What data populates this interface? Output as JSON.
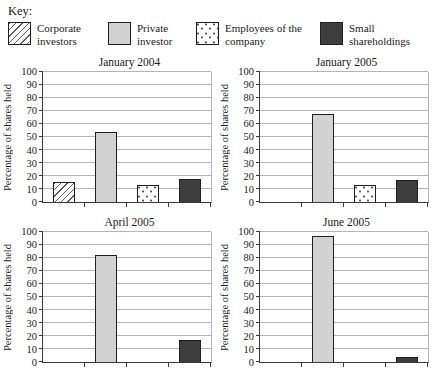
{
  "legend": {
    "heading": "Key:",
    "items": [
      {
        "label": "Corporate investors",
        "pattern": "diagonal-hatch"
      },
      {
        "label": "Private investor",
        "pattern": "solid-light-gray"
      },
      {
        "label": "Employees of the company",
        "pattern": "dotted"
      },
      {
        "label": "Small shareholdings",
        "pattern": "solid-dark-gray"
      }
    ]
  },
  "colors": {
    "light_gray_fill": "#d2d2d2",
    "dark_gray_fill": "#3d3d3d",
    "bar_border": "#1f1f1f",
    "gridline": "#b4b4b4",
    "axis": "#3a3a3a",
    "text": "#1a1a1a"
  },
  "chart_data": {
    "type": "bar",
    "title": "",
    "xlabel": "",
    "ylabel": "Percentage of shares held",
    "ylim": [
      0,
      100
    ],
    "ytick_step": 10,
    "grid": true,
    "legend_position": "top",
    "categories": [
      "Corporate investors",
      "Private investor",
      "Employees of the company",
      "Small shareholdings"
    ],
    "charts": [
      {
        "title": "January 2004",
        "values": [
          15,
          54,
          13,
          18
        ]
      },
      {
        "title": "January 2005",
        "values": [
          0,
          68,
          13,
          17
        ]
      },
      {
        "title": "April 2005",
        "values": [
          0,
          82,
          0,
          17
        ]
      },
      {
        "title": "June 2005",
        "values": [
          0,
          97,
          0,
          4
        ]
      }
    ]
  }
}
